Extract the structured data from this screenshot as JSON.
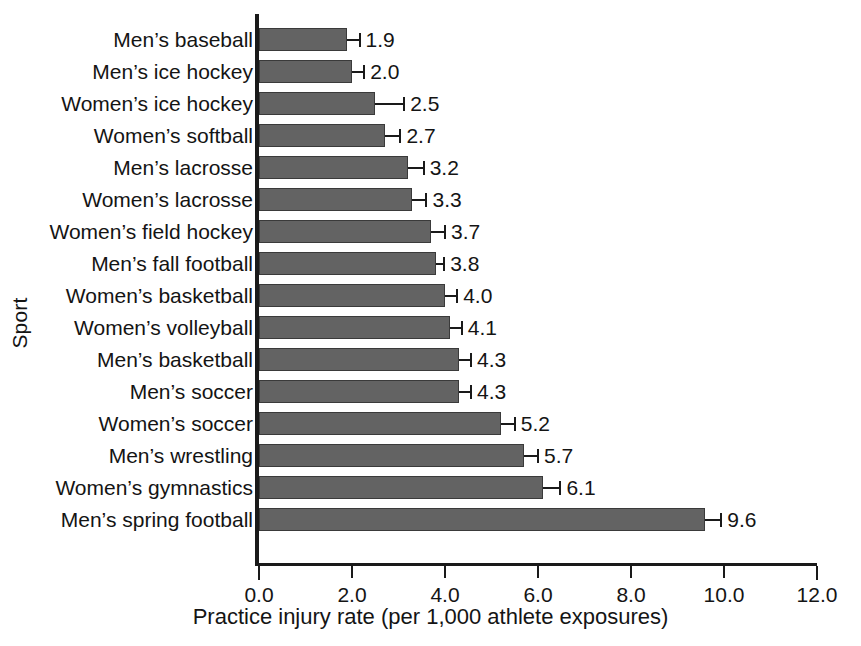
{
  "chart_data": {
    "type": "bar",
    "orientation": "horizontal",
    "title": "",
    "xlabel": "Practice injury rate (per 1,000 athlete exposures)",
    "ylabel": "Sport",
    "xlim": [
      0.0,
      12.0
    ],
    "xticks": [
      "0.0",
      "2.0",
      "4.0",
      "6.0",
      "8.0",
      "10.0",
      "12.0"
    ],
    "xtick_values": [
      0.0,
      2.0,
      4.0,
      6.0,
      8.0,
      10.0,
      12.0
    ],
    "grid": false,
    "legend": "none",
    "bar_color": "#636363",
    "categories": [
      "Men’s baseball",
      "Men’s ice hockey",
      "Women’s ice hockey",
      "Women’s softball",
      "Men’s lacrosse",
      "Women’s lacrosse",
      "Women’s field hockey",
      "Men’s fall football",
      "Women’s basketball",
      "Women’s volleyball",
      "Men’s basketball",
      "Men’s soccer",
      "Women’s soccer",
      "Men’s wrestling",
      "Women’s gymnastics",
      "Men’s spring football"
    ],
    "values": [
      1.9,
      2.0,
      2.5,
      2.7,
      3.2,
      3.3,
      3.7,
      3.8,
      4.0,
      4.1,
      4.3,
      4.3,
      5.2,
      5.7,
      6.1,
      9.6
    ],
    "value_labels": [
      "1.9",
      "2.0",
      "2.5",
      "2.7",
      "3.2",
      "3.3",
      "3.7",
      "3.8",
      "4.0",
      "4.1",
      "4.3",
      "4.3",
      "5.2",
      "5.7",
      "6.1",
      "9.6"
    ],
    "errors": [
      0.12,
      0.12,
      0.3,
      0.16,
      0.16,
      0.14,
      0.14,
      0.08,
      0.12,
      0.12,
      0.12,
      0.12,
      0.14,
      0.14,
      0.18,
      0.16
    ]
  }
}
